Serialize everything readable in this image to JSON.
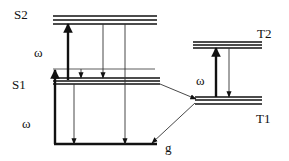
{
  "diagram": {
    "colors": {
      "line": "#111111",
      "thin": "#333333",
      "bg": "#ffffff"
    },
    "levels": [
      {
        "id": "S2",
        "label": "S2",
        "label_pos": [
          14,
          19
        ],
        "x1": 53,
        "x2": 157,
        "ys": [
          16,
          20,
          24
        ]
      },
      {
        "id": "S1",
        "label": "S1",
        "label_pos": [
          12,
          89
        ],
        "x1": 53,
        "x2": 160,
        "ys": [
          78,
          81,
          84
        ],
        "vib_line_y": 69
      },
      {
        "id": "T2",
        "label": "T2",
        "label_pos": [
          257,
          38
        ],
        "x1": 193,
        "x2": 262,
        "ys": [
          42,
          45,
          48
        ]
      },
      {
        "id": "T1",
        "label": "T1",
        "label_pos": [
          256,
          123
        ],
        "x1": 195,
        "x2": 262,
        "ys": [
          97,
          100,
          104
        ]
      },
      {
        "id": "g",
        "label": "g",
        "label_pos": [
          165,
          152
        ],
        "x1": 54,
        "x2": 157,
        "ys": [
          144
        ]
      }
    ],
    "omega_labels": [
      {
        "text": "ω",
        "pos": [
          34,
          57
        ]
      },
      {
        "text": "ω",
        "pos": [
          22,
          128
        ]
      },
      {
        "text": "ω",
        "pos": [
          196,
          85
        ]
      }
    ],
    "arrows": [
      {
        "name": "absorption-g-to-s1",
        "type": "thick",
        "x1": 55,
        "y1": 144,
        "x2": 55,
        "y2": 70
      },
      {
        "name": "absorption-s1-to-s2",
        "type": "thick",
        "x1": 68,
        "y1": 80,
        "x2": 68,
        "y2": 24
      },
      {
        "name": "fluorescence-s1-to-g",
        "type": "thin",
        "x1": 74,
        "y1": 84,
        "x2": 74,
        "y2": 144
      },
      {
        "name": "relaxation-vib-to-s1",
        "type": "thin",
        "x1": 81,
        "y1": 69,
        "x2": 81,
        "y2": 78
      },
      {
        "name": "decay-s2-to-s1",
        "type": "thin",
        "x1": 103,
        "y1": 24,
        "x2": 103,
        "y2": 78
      },
      {
        "name": "decay-s2-to-g",
        "type": "thin",
        "x1": 125,
        "y1": 24,
        "x2": 125,
        "y2": 144
      },
      {
        "name": "isc-s1-to-t1",
        "type": "thin",
        "x1": 160,
        "y1": 84,
        "x2": 196,
        "y2": 99
      },
      {
        "name": "phosphorescence-t1-to-g",
        "type": "thin",
        "x1": 195,
        "y1": 103,
        "x2": 152,
        "y2": 143
      },
      {
        "name": "absorption-t1-to-t2",
        "type": "thick",
        "x1": 216,
        "y1": 97,
        "x2": 216,
        "y2": 48
      },
      {
        "name": "decay-t2-to-t1",
        "type": "thin",
        "x1": 229,
        "y1": 48,
        "x2": 229,
        "y2": 97
      }
    ]
  }
}
